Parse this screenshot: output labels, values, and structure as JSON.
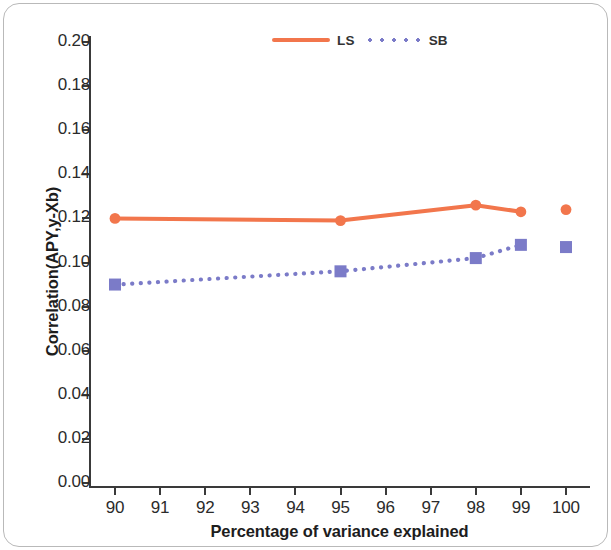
{
  "chart_data": {
    "type": "line",
    "title": "",
    "xlabel": "Percentage of variance explained",
    "ylabel": "Correlation(APY,y-Xb)",
    "x": [
      90,
      95,
      98,
      99,
      100
    ],
    "xlim": [
      89.45,
      100.55
    ],
    "ylim": [
      0.0,
      0.21
    ],
    "xticks": [
      90,
      91,
      92,
      93,
      94,
      95,
      96,
      97,
      98,
      99,
      100
    ],
    "xtick_labels": [
      "90",
      "91",
      "92",
      "93",
      "94",
      "95",
      "96",
      "97",
      "98",
      "99",
      "100"
    ],
    "yticks": [
      0.0,
      0.02,
      0.04,
      0.06,
      0.08,
      0.1,
      0.12,
      0.14,
      0.16,
      0.18,
      0.2
    ],
    "ytick_labels": [
      "0.00",
      "0.02",
      "0.04",
      "0.06",
      "0.08",
      "0.10",
      "0.12",
      "0.14",
      "0.16",
      "0.18",
      "0.20"
    ],
    "grid": false,
    "legend_position": "top-center",
    "series": [
      {
        "name": "LS",
        "color": "#F2764C",
        "linestyle": "solid",
        "marker": "circle",
        "x": [
          90,
          95,
          98,
          99
        ],
        "values": [
          0.12,
          0.119,
          0.126,
          0.123
        ],
        "detached_points": [
          {
            "x": 100,
            "y": 0.124
          }
        ]
      },
      {
        "name": "SB",
        "color": "#7B7BC8",
        "linestyle": "dotted",
        "marker": "square",
        "x": [
          90,
          95,
          98,
          99
        ],
        "values": [
          0.09,
          0.096,
          0.102,
          0.108
        ],
        "detached_points": [
          {
            "x": 100,
            "y": 0.107
          }
        ]
      }
    ]
  },
  "legend": {
    "entries": [
      {
        "label": "LS"
      },
      {
        "label": "SB"
      }
    ]
  },
  "axes": {
    "x_title": "Percentage of variance explained",
    "y_title": "Correlation(APY,y-Xb)"
  }
}
